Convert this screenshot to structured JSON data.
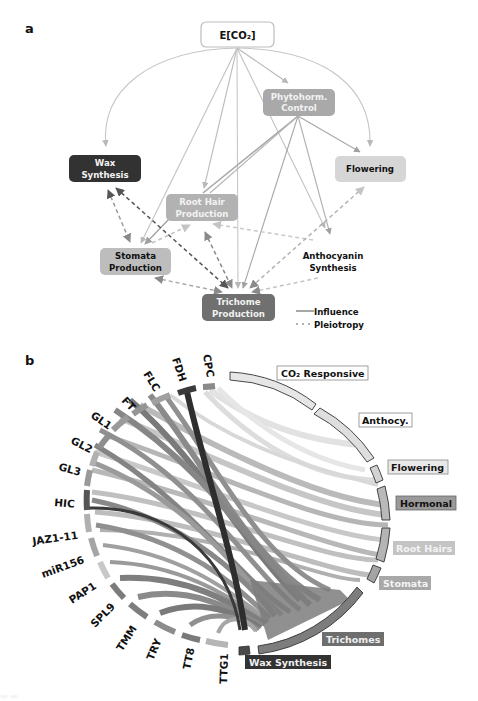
{
  "panel_a": {
    "label": "a",
    "nodes": {
      "eco2": "E[CO₂]",
      "phyto_line1": "Phytohorm.",
      "phyto_line2": "Control",
      "wax_line1": "Wax",
      "wax_line2": "Synthesis",
      "flowering": "Flowering",
      "roothair_line1": "Root Hair",
      "roothair_line2": "Production",
      "stomata_line1": "Stomata",
      "stomata_line2": "Production",
      "antho_line1": "Anthocyanin",
      "antho_line2": "Synthesis",
      "trichome_line1": "Trichome",
      "trichome_line2": "Production"
    },
    "legend": {
      "influence": "Influence",
      "pleiotropy": "Pleiotropy"
    },
    "colors": {
      "eco2_fill": "#ffffff",
      "phyto_fill": "#a9a9a9",
      "wax_fill": "#323232",
      "flowering_fill": "#d6d6d6",
      "roothair_fill": "#b2b2b2",
      "stomata_fill": "#bdbdbd",
      "trichome_fill": "#707070",
      "influence_edge": "#b8b8b8",
      "pleiotropy_edge": "#8a8a8a"
    }
  },
  "panel_b": {
    "label": "b",
    "genes": [
      "CPC",
      "FDH",
      "FLC",
      "FT",
      "GL1",
      "GL2",
      "GL3",
      "HIC",
      "JAZ1-11",
      "miR156",
      "PAP1",
      "SPL9",
      "TMM",
      "TRY",
      "TT8",
      "TTG1"
    ],
    "categories": [
      {
        "name": "CO₂ Responsive",
        "fill": "#e6e6e6",
        "label_bg": "#ffffff",
        "label_color": "#111111"
      },
      {
        "name": "Anthocy.",
        "fill": "#dedede",
        "label_bg": "#ffffff",
        "label_color": "#111111"
      },
      {
        "name": "Flowering",
        "fill": "#d2d2d2",
        "label_bg": "#e8e8e8",
        "label_color": "#111111"
      },
      {
        "name": "Hormonal",
        "fill": "#b9b9b9",
        "label_bg": "#9a9a9a",
        "label_color": "#111111"
      },
      {
        "name": "Root Hairs",
        "fill": "#b4b4b4",
        "label_bg": "#c4c4c4",
        "label_color": "#f4f4f4"
      },
      {
        "name": "Stomata",
        "fill": "#a4a4a4",
        "label_bg": "#a8a8a8",
        "label_color": "#f4f4f4"
      },
      {
        "name": "Trichomes",
        "fill": "#7d7d7d",
        "label_bg": "#6e6e6e",
        "label_color": "#f0f0f0"
      },
      {
        "name": "Wax Synthesis",
        "fill": "#4a4a4a",
        "label_bg": "#333333",
        "label_color": "#f0f0f0"
      }
    ]
  },
  "caption": "...  ..."
}
